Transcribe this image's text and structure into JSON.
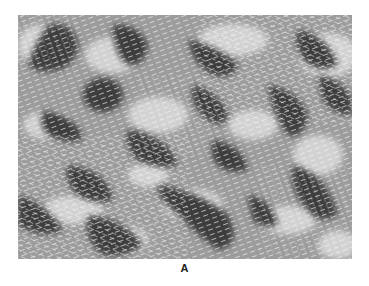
{
  "figure": {
    "panel_label": "A",
    "colors": {
      "background": "#9a9a9a",
      "dark_domain": "#3a3a3a",
      "light_domain": "#cfcfcf",
      "stroke": "#f2f2f2"
    }
  }
}
